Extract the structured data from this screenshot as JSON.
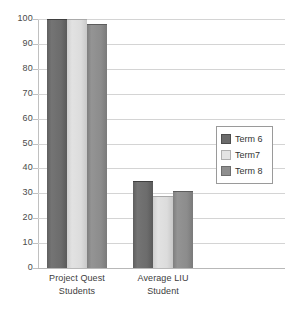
{
  "chart_data": {
    "type": "bar",
    "title": "",
    "subtitle": "",
    "xlabel": "",
    "ylabel": "",
    "ylim": [
      0,
      100
    ],
    "yticks": [
      0,
      10,
      20,
      30,
      40,
      50,
      60,
      70,
      80,
      90,
      100
    ],
    "ytick_labels": [
      "0",
      "10",
      "20",
      "30",
      "40",
      "50",
      "60",
      "70",
      "80",
      "90",
      "100"
    ],
    "grid": true,
    "legend_position": "right-middle",
    "categories": [
      "Project Quest Students",
      "Average LIU Student"
    ],
    "category_lines": [
      [
        "Project Quest",
        "Students"
      ],
      [
        "Average LIU",
        "Student"
      ]
    ],
    "series": [
      {
        "name": "Term 6",
        "color": "#6b6b6b",
        "values": [
          100,
          35
        ]
      },
      {
        "name": "Term7",
        "color": "#e4e4e4",
        "values": [
          100,
          29
        ]
      },
      {
        "name": "Term 8",
        "color": "#8e8e8e",
        "values": [
          98,
          31
        ]
      }
    ]
  },
  "legend": {
    "items": [
      {
        "label": "Term 6"
      },
      {
        "label": "Term7"
      },
      {
        "label": "Term 8"
      }
    ]
  },
  "colors": {
    "series_1": "#6b6b6b",
    "series_2": "#e4e4e4",
    "series_3": "#8e8e8e",
    "gridline": "#d4d4d4",
    "axis": "#c0c0c0",
    "text": "#3d3d3d",
    "background": "#ffffff"
  }
}
